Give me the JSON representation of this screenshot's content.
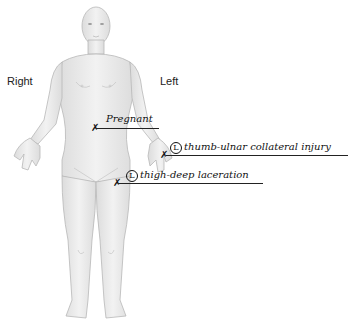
{
  "orientation_labels": {
    "right": "Right",
    "left": "Left"
  },
  "annotations": [
    {
      "id": "pregnant",
      "text": "Pregnant",
      "side_marker": "",
      "marker": "x"
    },
    {
      "id": "thumb",
      "text": "thumb-ulnar collateral injury",
      "side_marker": "L",
      "marker": "x"
    },
    {
      "id": "thigh",
      "text": "thigh-deep laceration",
      "side_marker": "L",
      "marker": "x"
    }
  ],
  "colors": {
    "skin_fill": "#ececec",
    "skin_outline": "#b5b5b5",
    "ink": "#111111"
  }
}
